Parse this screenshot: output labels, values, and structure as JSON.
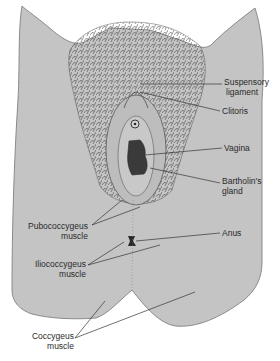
{
  "figure": {
    "type": "anatomical-illustration",
    "colors": {
      "skin": "#c4c4c4",
      "outline": "#8a8a8a",
      "hair": "#3a3a3a",
      "dark": "#2a2a2a",
      "leader": "#333333",
      "background": "#ffffff"
    }
  },
  "labels": {
    "suspensory_line1": "Suspensory",
    "suspensory_line2": "ligament",
    "clitoris": "Clitoris",
    "vagina": "Vagina",
    "bartholin_line1": "Bartholin's",
    "bartholin_line2": "gland",
    "anus": "Anus",
    "pubococcygeus_line1": "Pubococcygeus",
    "pubococcygeus_line2": "muscle",
    "iliococcygeus_line1": "Iliococcygeus",
    "iliococcygeus_line2": "muscle",
    "coccygeus_line1": "Coccygeus",
    "coccygeus_line2": "muscle"
  }
}
